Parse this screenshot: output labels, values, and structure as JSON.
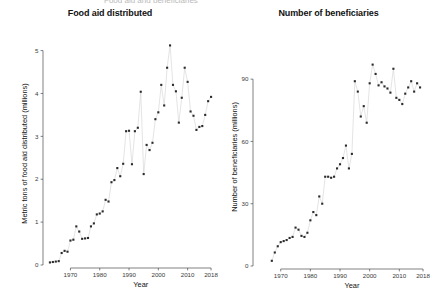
{
  "figure": {
    "background_color": "#ffffff",
    "dot_color": "#2b2b2b",
    "connector_color": "#d2d2d2",
    "axis_color": "#4a4a4a",
    "clipped_top_text": "Food aid and beneficiaries"
  },
  "chart_data": [
    {
      "type": "scatter",
      "panel": "left",
      "title": "Food aid distributed",
      "xlabel": "Year",
      "ylabel": "Metric tons of food aid distributed (millions)",
      "xlim": [
        1962,
        2019
      ],
      "ylim": [
        0,
        5.2
      ],
      "xticks": [
        1970,
        1980,
        1990,
        2000,
        2010,
        2018
      ],
      "xtick_labels": [
        "1970",
        "1980",
        "1990",
        "2000",
        "2010",
        "2018"
      ],
      "yticks": [
        0,
        1,
        2,
        3,
        4,
        5
      ],
      "ytick_labels": [
        "0",
        "1",
        "2",
        "3",
        "4",
        "5"
      ],
      "grid": false,
      "legend": "none",
      "connected_points": true,
      "x": [
        1963,
        1964,
        1965,
        1966,
        1967,
        1968,
        1969,
        1970,
        1971,
        1972,
        1973,
        1974,
        1975,
        1976,
        1977,
        1978,
        1979,
        1980,
        1981,
        1982,
        1983,
        1984,
        1985,
        1986,
        1987,
        1988,
        1989,
        1990,
        1991,
        1992,
        1993,
        1994,
        1995,
        1996,
        1997,
        1998,
        1999,
        2000,
        2001,
        2002,
        2003,
        2004,
        2005,
        2006,
        2007,
        2008,
        2009,
        2010,
        2011,
        2012,
        2013,
        2014,
        2015,
        2016,
        2017,
        2018
      ],
      "y": [
        0.06,
        0.07,
        0.08,
        0.09,
        0.28,
        0.33,
        0.31,
        0.57,
        0.59,
        0.9,
        0.78,
        0.61,
        0.62,
        0.63,
        0.9,
        0.97,
        1.18,
        1.2,
        1.25,
        1.52,
        1.48,
        1.93,
        1.98,
        2.26,
        2.07,
        2.36,
        3.12,
        3.13,
        2.35,
        3.12,
        3.2,
        4.04,
        2.12,
        2.8,
        2.68,
        2.85,
        3.4,
        3.56,
        4.2,
        3.72,
        4.6,
        5.12,
        4.2,
        4.05,
        3.32,
        3.9,
        4.6,
        4.27,
        3.58,
        3.48,
        3.15,
        3.22,
        3.24,
        3.5,
        3.82,
        3.92
      ]
    },
    {
      "type": "scatter",
      "panel": "right",
      "title": "Number of beneficiaries",
      "xlabel": "Year",
      "ylabel": "Number of beneficiaries (millions)",
      "xlim": [
        1962,
        2019
      ],
      "ylim": [
        0,
        105
      ],
      "xticks": [
        1970,
        1980,
        1990,
        2000,
        2010,
        2018
      ],
      "xtick_labels": [
        "1970",
        "1980",
        "1990",
        "2000",
        "2010",
        "2018"
      ],
      "yticks": [
        0,
        30,
        60,
        90
      ],
      "ytick_labels": [
        "0",
        "30",
        "60",
        "90"
      ],
      "grid": false,
      "legend": "none",
      "connected_points": true,
      "x": [
        1967,
        1968,
        1969,
        1970,
        1971,
        1972,
        1973,
        1974,
        1975,
        1976,
        1977,
        1978,
        1979,
        1980,
        1981,
        1982,
        1983,
        1984,
        1985,
        1986,
        1987,
        1988,
        1989,
        1990,
        1991,
        1992,
        1993,
        1994,
        1995,
        1996,
        1997,
        1998,
        1999,
        2000,
        2001,
        2002,
        2003,
        2004,
        2005,
        2006,
        2007,
        2008,
        2009,
        2010,
        2011,
        2012,
        2013,
        2014,
        2015,
        2016,
        2017
      ],
      "y": [
        2.5,
        6.5,
        9.5,
        11.5,
        12.0,
        12.5,
        13.5,
        14.0,
        18.5,
        17.5,
        14.5,
        14.0,
        16.0,
        22.0,
        26.0,
        24.5,
        33.5,
        30.0,
        43.0,
        43.0,
        42.5,
        43.0,
        47.0,
        49.0,
        52.0,
        58.0,
        47.0,
        54.0,
        89.0,
        84.0,
        72.0,
        77.0,
        69.0,
        88.0,
        97.0,
        92.5,
        87.0,
        88.5,
        86.5,
        85.5,
        83.5,
        95.0,
        81.0,
        80.0,
        78.0,
        83.0,
        86.0,
        89.0,
        84.0,
        88.0,
        86.0
      ]
    }
  ]
}
